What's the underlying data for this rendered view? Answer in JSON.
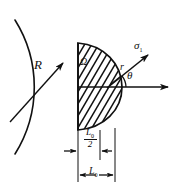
{
  "figure": {
    "kind": "engineering-diagram",
    "stroke_color": "#111111",
    "background_color": "#ffffff"
  },
  "labels": {
    "radius": "R",
    "omega": "Ω",
    "sigma": "σ",
    "sigma_subscript": "1",
    "radial": "r",
    "theta": "θ",
    "dim_half_num": "L",
    "dim_half_num_sub": "0",
    "dim_half_den": "2",
    "dim_full": "L",
    "dim_full_sub": "0"
  },
  "geometry": {
    "notch_arc": {
      "center_x": -48,
      "center_y": 87,
      "radius": 126,
      "start_deg": -58,
      "end_deg": 58
    },
    "plastic_zone": {
      "flat_edge_x": 78,
      "top_y": 43,
      "bottom_y": 130,
      "max_x": 122,
      "hatch_angle_deg": 60,
      "hatch_spacing_px": 7
    },
    "axis_arrow": {
      "x1": 78,
      "y1": 87,
      "x2": 171,
      "y2": 87
    },
    "sigma_arrow": {
      "x1": 108,
      "y1": 87,
      "x2": 152,
      "y2": 52,
      "angle_deg": 38
    },
    "r_tick": {
      "x1": 108,
      "y1": 87,
      "x2": 120,
      "y2": 77
    },
    "theta_arc": {
      "cx": 108,
      "cy": 87,
      "radius": 17,
      "from_deg": 0,
      "to_deg": 38
    },
    "radius_arrow": {
      "x1": 12,
      "y1": 120,
      "x2": 62,
      "y2": 64
    },
    "dimension_lines": {
      "left_x": 78,
      "mid_x": 100,
      "right_x": 115,
      "extension_top_y": 128,
      "extension_bottom_y": 182,
      "half_dim_y": 150,
      "full_dim_y": 175
    }
  }
}
